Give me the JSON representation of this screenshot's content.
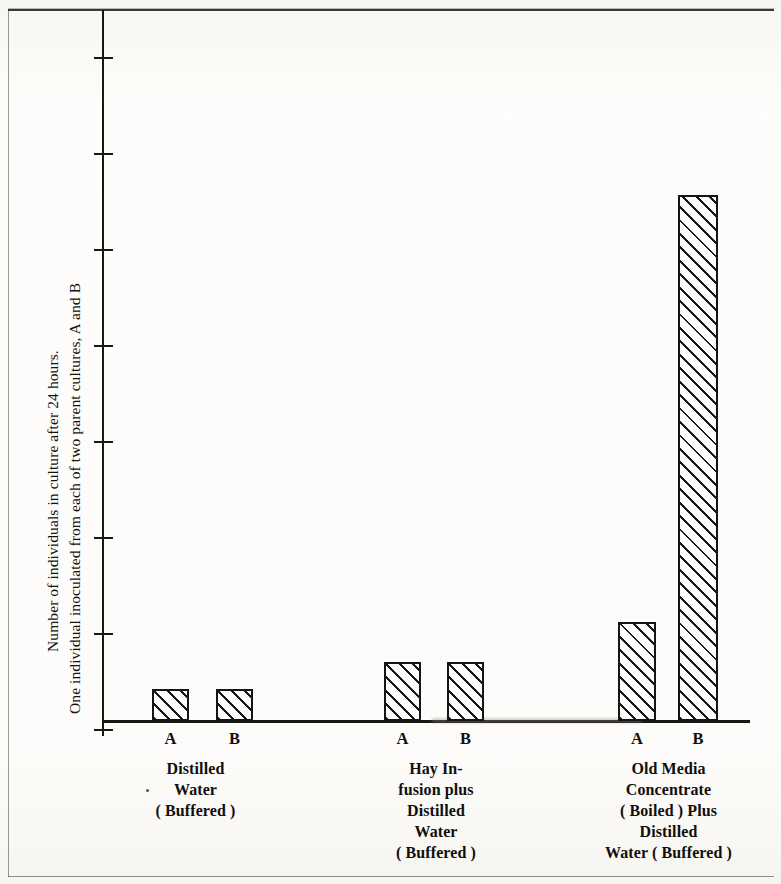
{
  "figure": {
    "axis_caption_line1": "Number of individuals in culture after 24 hours.",
    "axis_caption_line2": "One individual inoculated from each of two parent cultures, A and B"
  },
  "chart_data": {
    "type": "bar",
    "title": "",
    "subtitle": "",
    "xlabel": "",
    "ylabel": "Number of individuals in culture after 24 hours. One individual inoculated from each of two parent cultures, A and B",
    "grid": false,
    "legend": "none",
    "y_axis": {
      "tick_labels": [
        "",
        "",
        "",
        "",
        "",
        "",
        "",
        ""
      ],
      "tick_count": 8,
      "tick_unit_pixels": 96,
      "ylim_units": [
        0,
        7.4
      ],
      "note": "Unlabelled evenly spaced tick marks; values expressed in tick units above baseline."
    },
    "categories": [
      "Distilled Water (Buffered)",
      "Hay Infusion plus Distilled Water (Buffered)",
      "Old Media Concentrate (Boiled) Plus Distilled Water (Buffered)"
    ],
    "series": [
      {
        "name": "A",
        "values": [
          0.31,
          0.61,
          1.03
        ]
      },
      {
        "name": "B",
        "values": [
          0.31,
          0.61,
          5.48
        ]
      }
    ],
    "groups": [
      {
        "id": "distilled-water",
        "caption_lines": [
          "Distilled",
          "Water",
          "( Buffered )"
        ],
        "bars": [
          {
            "label": "A",
            "value": 0.31,
            "x": 152,
            "width": 37,
            "height_px": 32
          },
          {
            "label": "B",
            "value": 0.31,
            "x": 216,
            "width": 37,
            "height_px": 32
          }
        ]
      },
      {
        "id": "hay-infusion",
        "caption_lines": [
          "Hay In-",
          "fusion plus",
          "Distilled",
          "Water",
          "( Buffered )"
        ],
        "bars": [
          {
            "label": "A",
            "value": 0.61,
            "x": 384,
            "width": 37,
            "height_px": 59
          },
          {
            "label": "B",
            "value": 0.61,
            "x": 447,
            "width": 37,
            "height_px": 59
          }
        ]
      },
      {
        "id": "old-media-concentrate",
        "caption_lines": [
          "Old Media",
          "Concentrate",
          "( Boiled )  Plus",
          "Distilled",
          "Water   ( Buffered )"
        ],
        "bars": [
          {
            "label": "A",
            "value": 1.03,
            "x": 618,
            "width": 38,
            "height_px": 99
          },
          {
            "label": "B",
            "value": 5.48,
            "x": 678,
            "width": 40,
            "height_px": 526
          }
        ]
      }
    ]
  }
}
